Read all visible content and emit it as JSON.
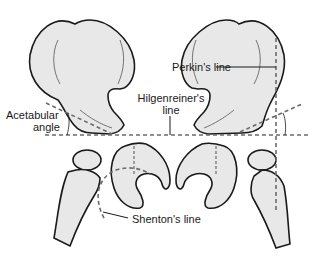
{
  "figure": {
    "labels": {
      "perkins_line": "Perkin's line",
      "hilgenreiner_line_1": "Hilgenreiner's",
      "hilgenreiner_line_2": "line",
      "acetabular_angle_1": "Acetabular",
      "acetabular_angle_2": "angle",
      "shentons_line": "Shenton's line"
    },
    "colors": {
      "bone_fill": "#e8e8e8",
      "outline": "#1a1a1a",
      "dashed_line": "#6b6b6b",
      "background": "#ffffff"
    }
  }
}
